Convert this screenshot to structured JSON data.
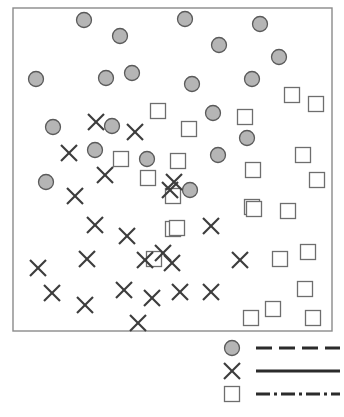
{
  "chart_data": {
    "type": "scatter",
    "title": "",
    "xlabel": "",
    "ylabel": "",
    "xlim": [
      0,
      100
    ],
    "ylim": [
      0,
      100
    ],
    "grid": false,
    "axis_ticks": false,
    "frame": {
      "x": 13,
      "y": 8,
      "width": 319,
      "height": 323
    },
    "colors": {
      "circle_fill": "#a8a8a8",
      "circle_stroke": "#5a5a5a",
      "square_fill": "#ffffff",
      "square_stroke": "#6e6e6e",
      "cross_stroke": "#3c3c3c",
      "frame_stroke": "#8a8a8a",
      "background": "#ffffff"
    },
    "marker_sizes": {
      "circle_r": 7.5,
      "square_s": 15,
      "cross_s": 16
    },
    "series": [
      {
        "name": "circle",
        "marker": "circle",
        "line_style": "dashed",
        "points": [
          [
            84,
            20
          ],
          [
            120,
            36
          ],
          [
            185,
            19
          ],
          [
            260,
            24
          ],
          [
            219,
            45
          ],
          [
            279,
            57
          ],
          [
            36,
            79
          ],
          [
            106,
            78
          ],
          [
            132,
            73
          ],
          [
            192,
            84
          ],
          [
            252,
            79
          ],
          [
            53,
            127
          ],
          [
            112,
            126
          ],
          [
            213,
            113
          ],
          [
            247,
            138
          ],
          [
            95,
            150
          ],
          [
            218,
            155
          ],
          [
            147,
            159
          ],
          [
            46,
            182
          ],
          [
            190,
            190
          ]
        ],
        "count": 20
      },
      {
        "name": "cross",
        "marker": "x",
        "line_style": "solid",
        "points": [
          [
            96,
            122
          ],
          [
            135,
            132
          ],
          [
            69,
            153
          ],
          [
            105,
            175
          ],
          [
            174,
            182
          ],
          [
            170,
            190
          ],
          [
            75,
            196
          ],
          [
            95,
            225
          ],
          [
            127,
            236
          ],
          [
            211,
            226
          ],
          [
            145,
            260
          ],
          [
            87,
            259
          ],
          [
            38,
            268
          ],
          [
            172,
            263
          ],
          [
            52,
            293
          ],
          [
            124,
            290
          ],
          [
            85,
            305
          ],
          [
            152,
            298
          ],
          [
            180,
            292
          ],
          [
            211,
            292
          ],
          [
            138,
            323
          ],
          [
            240,
            260
          ],
          [
            163,
            253
          ]
        ],
        "count": 23
      },
      {
        "name": "square",
        "marker": "square",
        "line_style": "dashdot",
        "points": [
          [
            158,
            111
          ],
          [
            292,
            95
          ],
          [
            316,
            104
          ],
          [
            245,
            117
          ],
          [
            189,
            129
          ],
          [
            121,
            159
          ],
          [
            178,
            161
          ],
          [
            253,
            170
          ],
          [
            303,
            155
          ],
          [
            148,
            178
          ],
          [
            252,
            207
          ],
          [
            317,
            180
          ],
          [
            254,
            209
          ],
          [
            288,
            211
          ],
          [
            173,
            196
          ],
          [
            173,
            229
          ],
          [
            154,
            259
          ],
          [
            280,
            259
          ],
          [
            308,
            252
          ],
          [
            305,
            289
          ],
          [
            273,
            309
          ],
          [
            251,
            318
          ],
          [
            313,
            318
          ],
          [
            177,
            228
          ]
        ],
        "count": 24
      }
    ]
  },
  "legend": {
    "position": "bottom-right",
    "box": {
      "x": 222,
      "y": 336,
      "width": 120,
      "height": 74
    },
    "entries": [
      {
        "id": "legend-entry-circle",
        "marker": "circle",
        "line_style": "dashed",
        "label": ""
      },
      {
        "id": "legend-entry-cross",
        "marker": "x",
        "line_style": "solid",
        "label": ""
      },
      {
        "id": "legend-entry-square",
        "marker": "square",
        "line_style": "dashdot",
        "label": ""
      }
    ]
  }
}
